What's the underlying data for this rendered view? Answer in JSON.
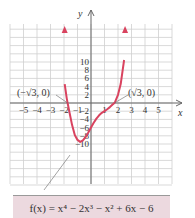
{
  "chart_data": {
    "type": "line",
    "title": "",
    "function": "f(x) = x^4 - 2x^3 - x^2 + 6x - 6",
    "formula_label": "f(x) = x⁴ − 2x³ − x² + 6x − 6",
    "xlabel": "x",
    "ylabel": "y",
    "xlim": [
      -5.5,
      5.8
    ],
    "ylim": [
      -11,
      12
    ],
    "grid": true,
    "x_ticks": [
      -5,
      -4,
      -3,
      -2,
      -1,
      1,
      2,
      3,
      4,
      5
    ],
    "x_tick_labels": [
      "−5",
      "−4",
      "−3",
      "−2",
      "−1",
      "1",
      "2",
      "3",
      "4",
      "5"
    ],
    "y_ticks": [
      10,
      8,
      6,
      4,
      2,
      -2,
      -4,
      -6,
      -8,
      -10
    ],
    "y_tick_labels": [
      "10",
      "8",
      "6",
      "4",
      "2",
      "−2",
      "−4",
      "−6",
      "−8",
      "−10"
    ],
    "annotations": [
      {
        "label": "(−√3, 0)",
        "x": -1.732,
        "y": 0
      },
      {
        "label": "(√3, 0)",
        "x": 1.732,
        "y": 0
      }
    ],
    "series": [
      {
        "name": "f(x)",
        "color": "#d9435f",
        "x": [
          -1.95,
          -1.8,
          -1.732,
          -1.6,
          -1.4,
          -1.2,
          -1.0,
          -0.8,
          -0.6,
          -0.4,
          -0.2,
          0.0,
          0.2,
          0.4,
          0.6,
          0.8,
          1.0,
          1.2,
          1.4,
          1.6,
          1.732,
          1.8,
          2.0,
          2.2,
          2.45
        ],
        "values": [
          4.6,
          1.19,
          0.0,
          -2.2,
          -5.4,
          -7.8,
          -9.0,
          -9.5,
          -9.1,
          -8.3,
          -7.2,
          -6.0,
          -4.8,
          -3.8,
          -3.0,
          -2.4,
          -2.0,
          -1.5,
          -1.0,
          -0.4,
          0.0,
          0.4,
          2.0,
          4.6,
          10.5
        ]
      }
    ]
  }
}
